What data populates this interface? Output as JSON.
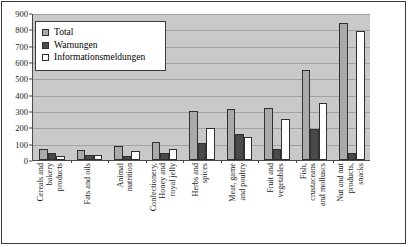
{
  "chart_data": {
    "type": "bar",
    "title": "",
    "xlabel": "",
    "ylabel": "",
    "ylim": [
      0,
      900
    ],
    "ytick_step": 100,
    "yticks": [
      0,
      100,
      200,
      300,
      400,
      500,
      600,
      700,
      800,
      900
    ],
    "grid": true,
    "legend_position": "top-left",
    "plot_background": "#c9c9c9",
    "categories": [
      "Cereals and bakery products",
      "Fats and oils",
      "Animal nutrition",
      "Confectionery, Honey and royal jelly",
      "Herbs and spices",
      "Meat, game and poultry",
      "Fruit and vegetables",
      "Fish, crustaceans and molluscs",
      "Nut and nut products, snacks"
    ],
    "category_lines": [
      [
        "Cereals and",
        "bakery",
        "products"
      ],
      [
        "Fats and oils"
      ],
      [
        "Animal",
        "nutrition"
      ],
      [
        "Confectionery,",
        "Honey and",
        "royal jelly"
      ],
      [
        "Herbs and",
        "spices"
      ],
      [
        "Meat, game",
        "and poultry"
      ],
      [
        "Fruit and",
        "vegetables"
      ],
      [
        "Fish,",
        "crustaceans",
        "and molluscs"
      ],
      [
        "Nut and nut",
        "products,",
        "snacks"
      ]
    ],
    "series": [
      {
        "name": "Total",
        "color": "#aaaaaa",
        "values": [
          65,
          60,
          85,
          110,
          300,
          310,
          320,
          550,
          840
        ]
      },
      {
        "name": "Warnungen",
        "color": "#4a4a4a",
        "values": [
          40,
          30,
          22,
          45,
          105,
          162,
          68,
          190,
          40
        ]
      },
      {
        "name": "Informationsmeldungen",
        "color": "#ffffff",
        "values": [
          22,
          32,
          58,
          68,
          193,
          140,
          250,
          352,
          790
        ]
      }
    ]
  }
}
